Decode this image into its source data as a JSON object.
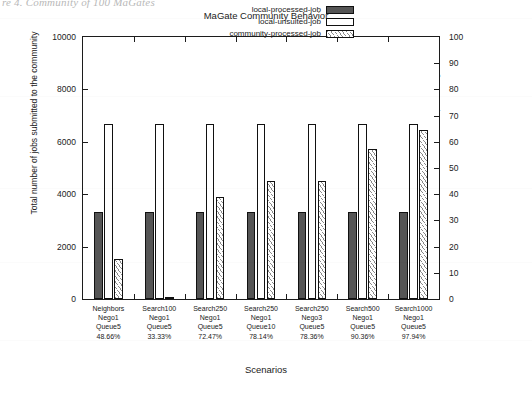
{
  "page": {
    "caption_fragment": "re 4. Community of 100 MaGates"
  },
  "chart_data": {
    "type": "bar",
    "title": "MaGate Community Behavior",
    "xlabel": "Scenarios",
    "ylabel": "Total number of jobs submitted to the community",
    "y2label": "percentage",
    "ylim": [
      0,
      10000
    ],
    "y2lim": [
      0,
      100
    ],
    "yticks": [
      "0",
      "2000",
      "4000",
      "6000",
      "8000",
      "10000"
    ],
    "y2ticks": [
      "0",
      "10",
      "20",
      "30",
      "40",
      "50",
      "60",
      "70",
      "80",
      "90",
      "100"
    ],
    "grid": false,
    "legend_position": "top-right-inside",
    "categories": [
      "Neighbors\nNego1\nQueue5\n48.66%",
      "Search100\nNego1\nQueue5\n33.33%",
      "Search250\nNego1\nQueue5\n72.47%",
      "Search250\nNego1\nQueue10\n78.14%",
      "Search250\nNego3\nQueue5\n78.36%",
      "Search500\nNego1\nQueue5\n90.36%",
      "Search1000\nNego1\nQueue5\n97.94%"
    ],
    "category_rows": [
      [
        "Neighbors",
        "Nego1",
        "Queue5",
        "48.66%"
      ],
      [
        "Search100",
        "Nego1",
        "Queue5",
        "33.33%"
      ],
      [
        "Search250",
        "Nego1",
        "Queue5",
        "72.47%"
      ],
      [
        "Search250",
        "Nego1",
        "Queue10",
        "78.14%"
      ],
      [
        "Search250",
        "Nego3",
        "Queue5",
        "78.36%"
      ],
      [
        "Search500",
        "Nego1",
        "Queue5",
        "90.36%"
      ],
      [
        "Search1000",
        "Nego1",
        "Queue5",
        "97.94%"
      ]
    ],
    "series": [
      {
        "name": "local-processed-job",
        "color": "#555555",
        "values": [
          3330,
          3330,
          3330,
          3330,
          3330,
          3330,
          3330
        ]
      },
      {
        "name": "local-unsuited-job",
        "color": "#ffffff",
        "values": [
          6670,
          6670,
          6670,
          6670,
          6670,
          6670,
          6670
        ]
      },
      {
        "name": "community-processed-job",
        "color": "#ffffff-hatched",
        "values": [
          1540,
          60,
          3910,
          4500,
          4510,
          5730,
          6470
        ]
      }
    ]
  },
  "legend": {
    "items": [
      {
        "label": "local-processed-job",
        "key": "s0"
      },
      {
        "label": "local-unsuited-job",
        "key": "s1"
      },
      {
        "label": "community-processed-job",
        "key": "s2"
      }
    ]
  }
}
